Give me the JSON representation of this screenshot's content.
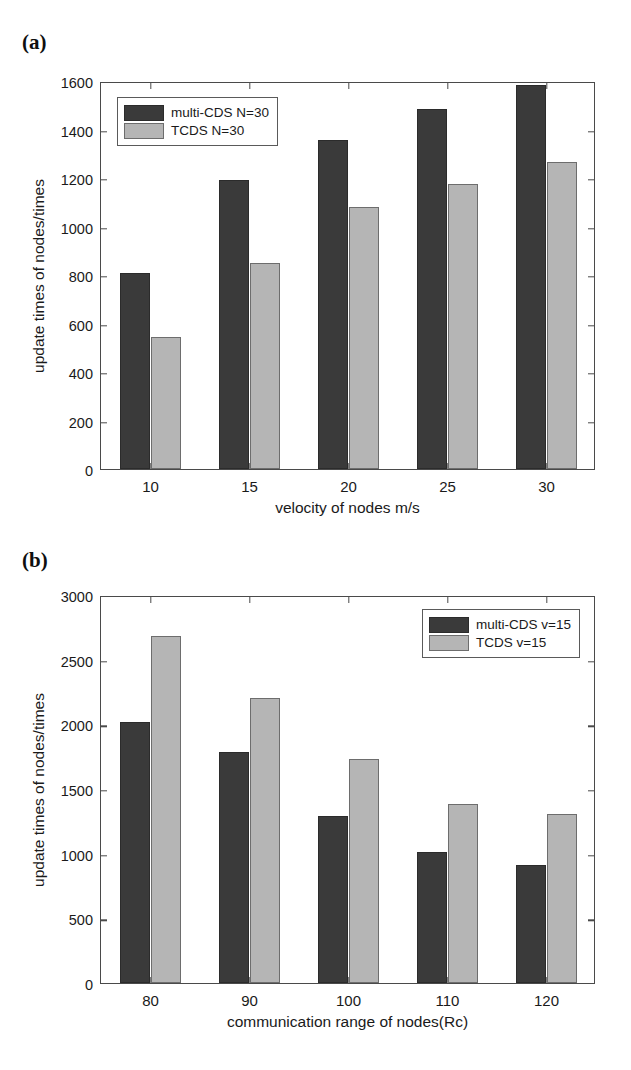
{
  "figure": {
    "background": "#ffffff",
    "series_colors": {
      "multi_cds": "#3a3a3a",
      "tcds": "#b5b5b5"
    }
  },
  "panels": [
    {
      "label": "(a)"
    },
    {
      "label": "(b)"
    }
  ],
  "chart_data": [
    {
      "type": "bar",
      "panel": "(a)",
      "title": "",
      "xlabel": "velocity of nodes m/s",
      "ylabel": "update times of nodes/times",
      "categories": [
        "10",
        "15",
        "20",
        "25",
        "30"
      ],
      "series": [
        {
          "name": "multi-CDS N=30",
          "color": "#3a3a3a",
          "values": [
            810,
            1190,
            1355,
            1485,
            1585
          ]
        },
        {
          "name": "TCDS N=30",
          "color": "#b5b5b5",
          "values": [
            545,
            850,
            1080,
            1175,
            1265
          ]
        }
      ],
      "ylim": [
        0,
        1600
      ],
      "yticks": [
        0,
        200,
        400,
        600,
        800,
        1000,
        1200,
        1400,
        1600
      ],
      "ytick_labels": [
        "0",
        "200",
        "400",
        "600",
        "800",
        "1000",
        "1200",
        "1400",
        "1600"
      ],
      "grid": false,
      "legend_position": "upper left"
    },
    {
      "type": "bar",
      "panel": "(b)",
      "title": "",
      "xlabel": "communication range of nodes(Rc)",
      "ylabel": "update times of nodes/times",
      "categories": [
        "80",
        "90",
        "100",
        "110",
        "120"
      ],
      "series": [
        {
          "name": "multi-CDS v=15",
          "color": "#3a3a3a",
          "values": [
            2020,
            1790,
            1290,
            1010,
            910
          ]
        },
        {
          "name": "TCDS v=15",
          "color": "#b5b5b5",
          "values": [
            2680,
            2200,
            1730,
            1385,
            1305
          ]
        }
      ],
      "ylim": [
        0,
        3000
      ],
      "yticks": [
        0,
        500,
        1000,
        1500,
        2000,
        2500,
        3000
      ],
      "ytick_labels": [
        "0",
        "500",
        "1000",
        "1500",
        "2000",
        "2500",
        "3000"
      ],
      "grid": false,
      "legend_position": "upper right"
    }
  ]
}
